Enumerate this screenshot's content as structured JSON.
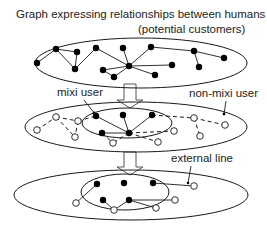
{
  "title_line1": "Graph expressing relationships between humans",
  "title_line2": "(potential customers)",
  "labels": {
    "mixi_user": "mixi user",
    "non_mixi_user": "non-mixi user",
    "external_line": "external line"
  },
  "colors": {
    "stroke": "#1a1a1a",
    "fill_node": "#000000",
    "open_node": "#ffffff",
    "background": "#ffffff"
  },
  "panels": [
    {
      "name": "full-graph",
      "ellipse": {
        "cx": 141,
        "cy": 63,
        "rx": 106,
        "ry": 25
      },
      "nodes_filled": [
        [
          37,
          63
        ],
        [
          56,
          49
        ],
        [
          77,
          52
        ],
        [
          75,
          69
        ],
        [
          96,
          48
        ],
        [
          123,
          48
        ],
        [
          103,
          70
        ],
        [
          114,
          77
        ],
        [
          129,
          66
        ],
        [
          151,
          47
        ],
        [
          172,
          65
        ],
        [
          155,
          75
        ],
        [
          194,
          51
        ],
        [
          224,
          58
        ],
        [
          199,
          67
        ]
      ],
      "edges": [
        [
          [
            37,
            63
          ],
          [
            56,
            49
          ]
        ],
        [
          [
            56,
            49
          ],
          [
            77,
            52
          ]
        ],
        [
          [
            56,
            49
          ],
          [
            75,
            69
          ]
        ],
        [
          [
            77,
            52
          ],
          [
            75,
            69
          ]
        ],
        [
          [
            75,
            69
          ],
          [
            96,
            48
          ]
        ],
        [
          [
            96,
            48
          ],
          [
            129,
            66
          ]
        ],
        [
          [
            123,
            48
          ],
          [
            129,
            66
          ]
        ],
        [
          [
            103,
            70
          ],
          [
            129,
            66
          ]
        ],
        [
          [
            103,
            70
          ],
          [
            114,
            77
          ]
        ],
        [
          [
            114,
            77
          ],
          [
            129,
            66
          ]
        ],
        [
          [
            129,
            66
          ],
          [
            151,
            47
          ]
        ],
        [
          [
            129,
            66
          ],
          [
            172,
            65
          ]
        ],
        [
          [
            129,
            66
          ],
          [
            155,
            75
          ]
        ],
        [
          [
            151,
            47
          ],
          [
            194,
            51
          ]
        ],
        [
          [
            194,
            51
          ],
          [
            224,
            58
          ]
        ],
        [
          [
            194,
            51
          ],
          [
            199,
            67
          ]
        ]
      ]
    },
    {
      "name": "mixi-subset",
      "ellipse": {
        "cx": 136,
        "cy": 127,
        "rx": 111,
        "ry": 25
      },
      "inner_ellipse": {
        "cx": 127,
        "cy": 123,
        "rx": 45,
        "ry": 15
      },
      "nodes_filled": [
        [
          96,
          116
        ],
        [
          123,
          115
        ],
        [
          152,
          115
        ],
        [
          102,
          133
        ],
        [
          129,
          133
        ]
      ],
      "nodes_open": [
        [
          37,
          130
        ],
        [
          56,
          117
        ],
        [
          78,
          121
        ],
        [
          75,
          137
        ],
        [
          113,
          143
        ],
        [
          158,
          142
        ],
        [
          174,
          131
        ],
        [
          194,
          118
        ],
        [
          225,
          125
        ],
        [
          200,
          136
        ]
      ],
      "edges": [
        [
          [
            96,
            116
          ],
          [
            129,
            133
          ]
        ],
        [
          [
            123,
            115
          ],
          [
            129,
            133
          ]
        ],
        [
          [
            152,
            115
          ],
          [
            129,
            133
          ]
        ],
        [
          [
            102,
            133
          ],
          [
            129,
            133
          ]
        ]
      ],
      "dashed_edges": [
        [
          [
            37,
            130
          ],
          [
            56,
            117
          ]
        ],
        [
          [
            56,
            117
          ],
          [
            78,
            121
          ]
        ],
        [
          [
            56,
            117
          ],
          [
            75,
            137
          ]
        ],
        [
          [
            78,
            121
          ],
          [
            75,
            137
          ]
        ],
        [
          [
            78,
            121
          ],
          [
            96,
            116
          ]
        ],
        [
          [
            102,
            133
          ],
          [
            113,
            143
          ]
        ],
        [
          [
            129,
            133
          ],
          [
            113,
            143
          ]
        ],
        [
          [
            129,
            133
          ],
          [
            158,
            142
          ]
        ],
        [
          [
            129,
            133
          ],
          [
            174,
            131
          ]
        ],
        [
          [
            152,
            115
          ],
          [
            194,
            118
          ]
        ],
        [
          [
            194,
            118
          ],
          [
            225,
            125
          ]
        ],
        [
          [
            194,
            118
          ],
          [
            200,
            136
          ]
        ]
      ]
    },
    {
      "name": "external-lines",
      "ellipse": {
        "cx": 131,
        "cy": 195,
        "rx": 117,
        "ry": 25
      },
      "inner_ellipse": {
        "cx": 125,
        "cy": 192,
        "rx": 44,
        "ry": 18
      },
      "nodes_filled": [
        [
          97,
          184
        ],
        [
          124,
          183
        ],
        [
          153,
          183
        ],
        [
          103,
          200
        ],
        [
          129,
          200
        ]
      ],
      "nodes_open": [
        [
          76,
          203
        ],
        [
          114,
          210
        ],
        [
          156,
          208
        ],
        [
          175,
          200
        ],
        [
          194,
          186
        ]
      ],
      "edges": [
        [
          [
            97,
            184
          ],
          [
            76,
            203
          ]
        ],
        [
          [
            103,
            200
          ],
          [
            114,
            210
          ]
        ],
        [
          [
            129,
            200
          ],
          [
            114,
            210
          ]
        ],
        [
          [
            129,
            200
          ],
          [
            156,
            208
          ]
        ],
        [
          [
            129,
            200
          ],
          [
            175,
            200
          ]
        ],
        [
          [
            153,
            183
          ],
          [
            194,
            186
          ]
        ]
      ]
    }
  ]
}
